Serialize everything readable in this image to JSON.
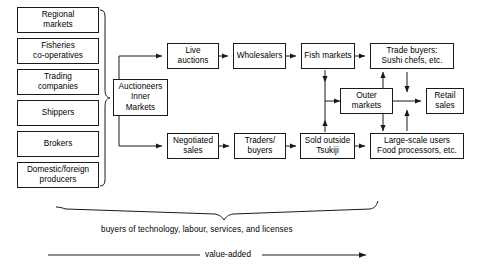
{
  "diagram": {
    "stroke_color": "#1a1a1a",
    "background_color": "#ffffff",
    "suppliers": [
      {
        "id": "regional-markets",
        "label": "Regional\nmarkets"
      },
      {
        "id": "fisheries-cooperatives",
        "label": "Fisheries\nco-operatives"
      },
      {
        "id": "trading-companies",
        "label": "Trading\ncompanies"
      },
      {
        "id": "shippers",
        "label": "Shippers"
      },
      {
        "id": "brokers",
        "label": "Brokers"
      },
      {
        "id": "domestic-foreign-producers",
        "label": "Domestic/foreign\nproducers"
      }
    ],
    "hub": {
      "id": "auctioneers-inner-markets",
      "label": "Auctioneers\nInner\nMarkets"
    },
    "upper_chain": [
      {
        "id": "live-auctions",
        "label": "Live\nauctions"
      },
      {
        "id": "wholesalers",
        "label": "Wholesalers"
      },
      {
        "id": "fish-markets",
        "label": "Fish markets"
      },
      {
        "id": "trade-buyers",
        "label": "Trade buyers:\nSushi chefs, etc."
      }
    ],
    "lower_chain": [
      {
        "id": "negotiated-sales",
        "label": "Negotiated\nsales"
      },
      {
        "id": "traders-buyers",
        "label": "Traders/\nbuyers"
      },
      {
        "id": "sold-outside-tsukiji",
        "label": "Sold outside\nTsukiji"
      },
      {
        "id": "large-scale-users",
        "label": "Large-scale users\nFood processors, etc."
      }
    ],
    "middle": {
      "id": "outer-markets",
      "label": "Outer\nmarkets"
    },
    "terminal": {
      "id": "retail-sales",
      "label": "Retail\nsales"
    },
    "annotations": {
      "buyers_note": "buyers of technology, labour, services, and licenses",
      "value_axis": "value-added"
    }
  }
}
